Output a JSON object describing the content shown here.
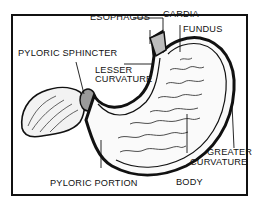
{
  "diagram": {
    "labels": {
      "esophagus": "ESOPHAGUS",
      "cardia": "CARDIA",
      "fundus": "FUNDUS",
      "pyloric_sphincter": "PYLORIC SPHINCTER",
      "lesser_curvature_1": "LESSER",
      "lesser_curvature_2": "CURVATURE",
      "greater_curvature_1": "GREATER",
      "greater_curvature_2": "CURVATURE",
      "pyloric_portion": "PYLORIC PORTION",
      "body": "BODY"
    },
    "colors": {
      "ink": "#111111",
      "background": "#ffffff"
    }
  }
}
